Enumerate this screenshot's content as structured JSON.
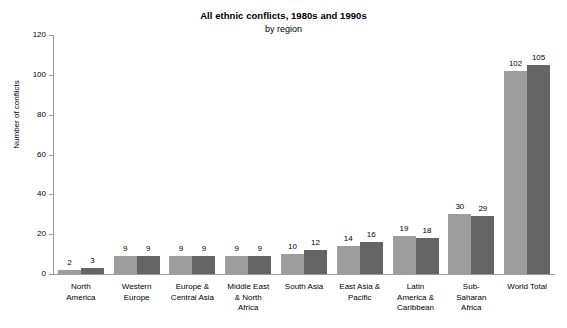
{
  "chart_data": {
    "type": "bar",
    "title": "All ethnic conflicts, 1980s and 1990s",
    "subtitle": "by region",
    "xlabel": "",
    "ylabel": "Number of conflicts",
    "ylim": [
      0,
      120
    ],
    "yticks": [
      0,
      20,
      40,
      60,
      80,
      100,
      120
    ],
    "grid": false,
    "legend": "none",
    "categories": [
      "North America",
      "Western Europe",
      "Europe & Central Asia",
      "Middle East & North Africa",
      "South Asia",
      "East Asia & Pacific",
      "Latin America & Caribbean",
      "Sub-Saharan Africa",
      "World Total"
    ],
    "series": [
      {
        "name": "1980s",
        "color": "#9d9d9d",
        "values": [
          2,
          9,
          9,
          9,
          10,
          14,
          19,
          30,
          102
        ]
      },
      {
        "name": "1990s",
        "color": "#656565",
        "values": [
          3,
          9,
          9,
          9,
          12,
          16,
          18,
          29,
          105
        ]
      }
    ]
  },
  "axis": {
    "y_title": "Number of conflicts",
    "tick_labels": [
      "0",
      "20",
      "40",
      "60",
      "80",
      "100",
      "120"
    ]
  },
  "category_labels": [
    "North\nAmerica",
    "Western\nEurope",
    "Europe &\nCentral Asia",
    "Middle East\n& North\nAfrica",
    "South Asia",
    "East Asia &\nPacific",
    "Latin\nAmerica &\nCaribbean",
    "Sub-\nSaharan\nAfrica",
    "World Total"
  ],
  "data_labels": {
    "series_0": [
      "2",
      "9",
      "9",
      "9",
      "10",
      "14",
      "19",
      "30",
      "102"
    ],
    "series_1": [
      "3",
      "9",
      "9",
      "9",
      "12",
      "16",
      "18",
      "29",
      "105"
    ]
  },
  "colors": {
    "series_0": "#9d9d9d",
    "series_1": "#656565",
    "axis": "#9a9a9a",
    "text": "#000000",
    "background": "#ffffff"
  }
}
